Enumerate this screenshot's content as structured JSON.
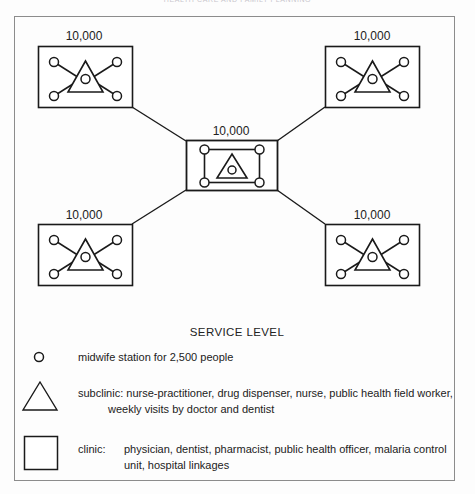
{
  "figure": {
    "title": "HEALTH CARE AND FAMILY PLANNING",
    "frame": {
      "present": true,
      "border_color": "#8c8c8c"
    }
  },
  "diagram": {
    "type": "hierarchical-network",
    "population_labels": [
      {
        "id": "top-left",
        "value": "10,000"
      },
      {
        "id": "top-right",
        "value": "10,000"
      },
      {
        "id": "center",
        "value": "10,000"
      },
      {
        "id": "bottom-left",
        "value": "10,000"
      },
      {
        "id": "bottom-right",
        "value": "10,000"
      }
    ],
    "units": [
      {
        "id": "top-left",
        "kind": "subclinic-unit",
        "population": "10,000",
        "midwife_stations": 4
      },
      {
        "id": "top-right",
        "kind": "subclinic-unit",
        "population": "10,000",
        "midwife_stations": 4
      },
      {
        "id": "center",
        "kind": "clinic-unit",
        "population": "10,000",
        "midwife_stations": 4
      },
      {
        "id": "bottom-left",
        "kind": "subclinic-unit",
        "population": "10,000",
        "midwife_stations": 4
      },
      {
        "id": "bottom-right",
        "kind": "subclinic-unit",
        "population": "10,000",
        "midwife_stations": 4
      }
    ],
    "connections": [
      {
        "from": "top-left",
        "to": "center"
      },
      {
        "from": "top-right",
        "to": "center"
      },
      {
        "from": "bottom-left",
        "to": "center"
      },
      {
        "from": "bottom-right",
        "to": "center"
      }
    ]
  },
  "legend": {
    "heading": "SERVICE LEVEL",
    "entries": [
      {
        "symbol": "circle",
        "symbol_name": "midwife-station-circle-icon",
        "label": "",
        "text": "midwife station for 2,500 people",
        "text2": ""
      },
      {
        "symbol": "triangle",
        "symbol_name": "subclinic-triangle-icon",
        "label": "subclinic:",
        "text": "subclinic: nurse-practitioner, drug dispenser, nurse, public health field worker,",
        "text2": "weekly visits by doctor and dentist"
      },
      {
        "symbol": "square",
        "symbol_name": "clinic-square-icon",
        "label": "clinic:",
        "text": "physician, dentist, pharmacist, public health officer, malaria control",
        "text2": "unit, hospital linkages"
      }
    ]
  },
  "colors": {
    "stroke": "#1a1a1a",
    "frame": "#8c8c8c",
    "background": "#fdfdfd",
    "title": "#c9c7cd"
  }
}
